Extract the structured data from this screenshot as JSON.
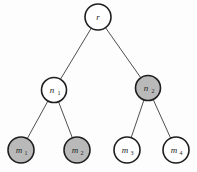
{
  "diagram": {
    "type": "tree",
    "colors": {
      "shaded_fill": "#b9b9b9",
      "unshaded_fill": "#ffffff",
      "stroke": "#1e1e1e",
      "edge": "#3a3a3a"
    },
    "nodes": [
      {
        "id": "r",
        "base": "r",
        "sub": "",
        "shaded": false,
        "cx": 98,
        "cy": 17,
        "r": 13
      },
      {
        "id": "n1",
        "base": "n",
        "sub": "1",
        "shaded": false,
        "cx": 54,
        "cy": 90,
        "r": 12.5
      },
      {
        "id": "n2",
        "base": "n",
        "sub": "2",
        "shaded": true,
        "cx": 148,
        "cy": 88,
        "r": 12.5
      },
      {
        "id": "m1",
        "base": "m",
        "sub": "1",
        "shaded": true,
        "cx": 21,
        "cy": 150,
        "r": 13
      },
      {
        "id": "m2",
        "base": "m",
        "sub": "2",
        "shaded": true,
        "cx": 77,
        "cy": 150,
        "r": 13
      },
      {
        "id": "m3",
        "base": "m",
        "sub": "3",
        "shaded": false,
        "cx": 127,
        "cy": 150,
        "r": 13
      },
      {
        "id": "m4",
        "base": "m",
        "sub": "4",
        "shaded": false,
        "cx": 176,
        "cy": 150,
        "r": 13
      }
    ],
    "edges": [
      {
        "from": "r",
        "to": "n1"
      },
      {
        "from": "r",
        "to": "n2"
      },
      {
        "from": "n1",
        "to": "m1"
      },
      {
        "from": "n1",
        "to": "m2"
      },
      {
        "from": "n2",
        "to": "m3"
      },
      {
        "from": "n2",
        "to": "m4"
      }
    ]
  }
}
